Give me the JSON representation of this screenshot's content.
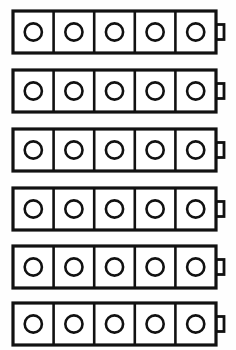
{
  "diagram": {
    "type": "line-art",
    "background_color": "#fefefe",
    "stroke_color": "#111111",
    "fill_color": "#ffffff",
    "row_count": 6,
    "cells_per_row": 5,
    "symbol_name": "battery-with-five-cells",
    "cell_marker": "circle",
    "geometry": {
      "canvas_width": 236,
      "canvas_height": 350,
      "body_left": 13,
      "body_width": 203,
      "body_height": 42,
      "row_pitch": 59,
      "first_row_top": 11,
      "cell_width": 40.6,
      "circle_radius": 8.6,
      "nub_width": 8,
      "nub_height": 15
    },
    "rows": [
      {
        "label": "battery-row-1",
        "top": 11,
        "cells": [
          {
            "label": "cell-1-1"
          },
          {
            "label": "cell-1-2"
          },
          {
            "label": "cell-1-3"
          },
          {
            "label": "cell-1-4"
          },
          {
            "label": "cell-1-5"
          }
        ]
      },
      {
        "label": "battery-row-2",
        "top": 70,
        "cells": [
          {
            "label": "cell-2-1"
          },
          {
            "label": "cell-2-2"
          },
          {
            "label": "cell-2-3"
          },
          {
            "label": "cell-2-4"
          },
          {
            "label": "cell-2-5"
          }
        ]
      },
      {
        "label": "battery-row-3",
        "top": 129,
        "cells": [
          {
            "label": "cell-3-1"
          },
          {
            "label": "cell-3-2"
          },
          {
            "label": "cell-3-3"
          },
          {
            "label": "cell-3-4"
          },
          {
            "label": "cell-3-5"
          }
        ]
      },
      {
        "label": "battery-row-4",
        "top": 188,
        "cells": [
          {
            "label": "cell-4-1"
          },
          {
            "label": "cell-4-2"
          },
          {
            "label": "cell-4-3"
          },
          {
            "label": "cell-4-4"
          },
          {
            "label": "cell-4-5"
          }
        ]
      },
      {
        "label": "battery-row-5",
        "top": 246,
        "cells": [
          {
            "label": "cell-5-1"
          },
          {
            "label": "cell-5-2"
          },
          {
            "label": "cell-5-3"
          },
          {
            "label": "cell-5-4"
          },
          {
            "label": "cell-5-5"
          }
        ]
      },
      {
        "label": "battery-row-6",
        "top": 303,
        "cells": [
          {
            "label": "cell-6-1"
          },
          {
            "label": "cell-6-2"
          },
          {
            "label": "cell-6-3"
          },
          {
            "label": "cell-6-4"
          },
          {
            "label": "cell-6-5"
          }
        ]
      }
    ]
  }
}
